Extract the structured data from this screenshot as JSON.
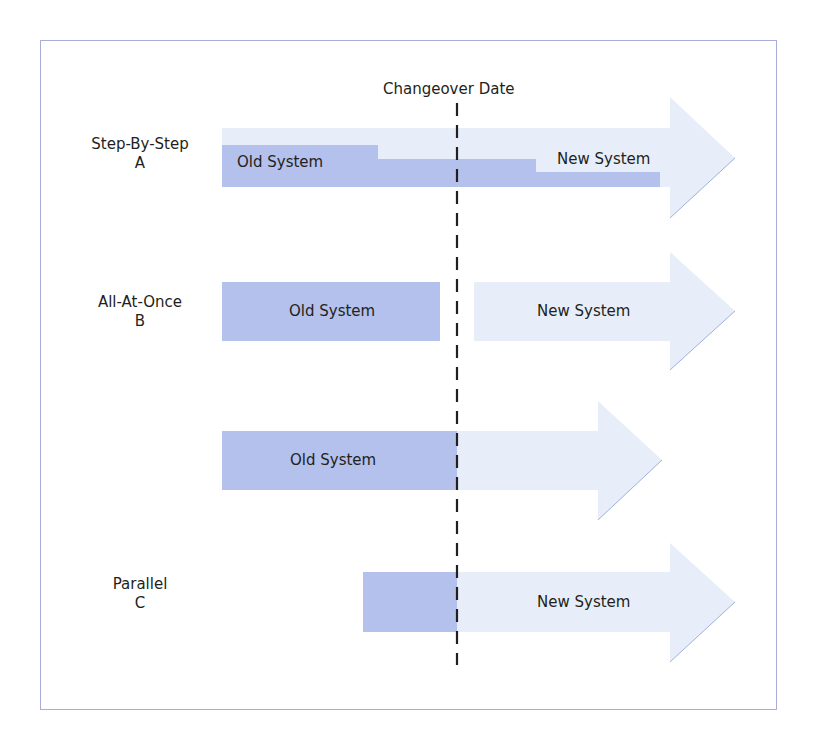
{
  "diagram": {
    "title": "Changeover Date",
    "colors": {
      "old_system": "#b4c1ec",
      "new_system": "#e7eef9",
      "new_system_edge": "#9fb0dd",
      "changeover_line": "#231f20",
      "frame": "#a9addc"
    },
    "rows": [
      {
        "name": "Step-By-Step",
        "letter": "A",
        "old_label": "Old System",
        "new_label": "New System"
      },
      {
        "name": "All-At-Once",
        "letter": "B",
        "old_label": "Old System",
        "new_label": "New System"
      },
      {
        "name": "",
        "letter": "",
        "old_label": "Old System",
        "new_label": ""
      },
      {
        "name": "Parallel",
        "letter": "C",
        "old_label": "",
        "new_label": "New System"
      }
    ]
  }
}
